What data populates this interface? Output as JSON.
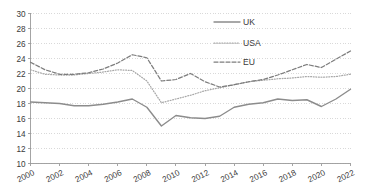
{
  "chart_data": {
    "type": "line",
    "title": "",
    "subtitle": "",
    "xlabel": "",
    "ylabel": "",
    "xlim": [
      2000,
      2022
    ],
    "ylim": [
      10,
      30
    ],
    "ytick_step": 2,
    "xtick_step": 2,
    "grid": "horizontal-dotted",
    "legend_position": "top-right-inside",
    "x": [
      2000,
      2001,
      2002,
      2003,
      2004,
      2005,
      2006,
      2007,
      2008,
      2009,
      2010,
      2011,
      2012,
      2013,
      2014,
      2015,
      2016,
      2017,
      2018,
      2019,
      2020,
      2021,
      2022
    ],
    "xtick_labels": [
      "2000",
      "2002",
      "2004",
      "2006",
      "2008",
      "2010",
      "2012",
      "2014",
      "2016",
      "2018",
      "2020",
      "2022"
    ],
    "ytick_labels": [
      "10",
      "12",
      "14",
      "16",
      "18",
      "20",
      "22",
      "24",
      "26",
      "28",
      "30"
    ],
    "series": [
      {
        "name": "UK",
        "style": "solid",
        "color": "#8c8c8c",
        "values": [
          18.2,
          18.1,
          18.0,
          17.7,
          17.7,
          17.9,
          18.2,
          18.6,
          17.5,
          15.0,
          16.4,
          16.1,
          16.0,
          16.3,
          17.5,
          17.9,
          18.1,
          18.6,
          18.4,
          18.5,
          17.6,
          18.6,
          19.9
        ]
      },
      {
        "name": "USA",
        "style": "dotted",
        "color": "#a8a8a8",
        "values": [
          22.5,
          21.9,
          21.8,
          21.8,
          22.0,
          22.2,
          22.5,
          22.4,
          21.0,
          18.1,
          18.6,
          19.1,
          19.7,
          20.1,
          20.5,
          20.9,
          21.1,
          21.3,
          21.4,
          21.6,
          21.5,
          21.6,
          21.9
        ]
      },
      {
        "name": "EU",
        "style": "dashed",
        "color": "#7d7d7d",
        "values": [
          23.5,
          22.5,
          21.9,
          21.9,
          22.1,
          22.6,
          23.4,
          24.5,
          24.1,
          21.0,
          21.2,
          22.0,
          20.9,
          20.2,
          20.5,
          20.9,
          21.2,
          21.8,
          22.5,
          23.2,
          22.8,
          23.9,
          25.0
        ]
      }
    ]
  },
  "legend": {
    "items": [
      {
        "label": "UK"
      },
      {
        "label": "USA"
      },
      {
        "label": "EU"
      }
    ]
  },
  "colors": {
    "axis": "#9a9a9a",
    "grid": "#c9c9c9",
    "text": "#3a3a3a",
    "background": "#ffffff"
  }
}
